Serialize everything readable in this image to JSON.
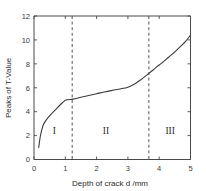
{
  "chart_data": {
    "type": "line",
    "title": "",
    "xlabel": "Depth of crack d /mm",
    "ylabel": "Peaks of T-Value",
    "xlim": [
      0,
      5
    ],
    "ylim": [
      0,
      12
    ],
    "xticks": [
      0,
      1,
      2,
      3,
      4,
      5
    ],
    "yticks": [
      0,
      2,
      4,
      6,
      8,
      10,
      12
    ],
    "xtick_labels": [
      "0",
      "1",
      "2",
      "3",
      "4",
      "5"
    ],
    "ytick_labels": [
      "0",
      "2",
      "4",
      "6",
      "8",
      "10",
      "12"
    ],
    "grid": false,
    "legend": false,
    "series": [
      {
        "name": "Peaks of T-Value",
        "x": [
          0.15,
          0.2,
          0.25,
          0.3,
          0.35,
          0.45,
          0.55,
          0.7,
          0.85,
          1.0,
          1.1,
          1.25,
          1.5,
          1.75,
          2.0,
          2.25,
          2.5,
          2.75,
          3.0,
          3.2,
          3.4,
          3.67,
          3.9,
          4.1,
          4.3,
          4.5,
          4.7,
          4.85,
          5.0
        ],
        "y": [
          1.0,
          1.9,
          2.5,
          2.9,
          3.15,
          3.5,
          3.8,
          4.2,
          4.6,
          4.95,
          5.0,
          5.05,
          5.2,
          5.35,
          5.5,
          5.65,
          5.78,
          5.9,
          6.05,
          6.3,
          6.65,
          7.2,
          7.7,
          8.1,
          8.55,
          9.0,
          9.5,
          9.9,
          10.4
        ]
      }
    ],
    "dividers": [
      {
        "x": 1.22,
        "style": "dashed"
      },
      {
        "x": 3.67,
        "style": "dashed"
      }
    ],
    "annotations": [
      {
        "text": "I",
        "x": 0.65,
        "y": 2.1
      },
      {
        "text": "II",
        "x": 2.3,
        "y": 2.1
      },
      {
        "text": "III",
        "x": 4.35,
        "y": 2.1
      }
    ]
  }
}
